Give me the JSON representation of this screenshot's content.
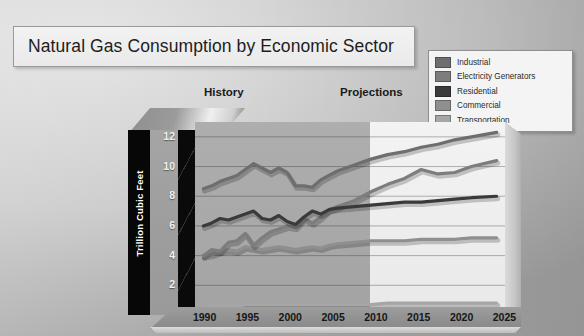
{
  "slide": {
    "title": "Natural Gas Consumption by Economic Sector"
  },
  "captions": {
    "history": "History",
    "projections": "Projections"
  },
  "legend": {
    "items": [
      {
        "label": "Industrial",
        "color": "#6e6e6e"
      },
      {
        "label": "Electricity Generators",
        "color": "#7d7d7d"
      },
      {
        "label": "Residential",
        "color": "#3a3a3a"
      },
      {
        "label": "Commercial",
        "color": "#8f8f8f"
      },
      {
        "label": "Transportation",
        "color": "#a6a6a6"
      }
    ]
  },
  "chart_data": {
    "type": "line",
    "title": "Natural Gas Consumption by Economic Sector",
    "xlabel": "",
    "ylabel": "Trillion Cubic Feet",
    "xlim": [
      1989,
      2026
    ],
    "ylim": [
      0,
      13
    ],
    "yticks": [
      0,
      2,
      4,
      6,
      8,
      10,
      12
    ],
    "xticks": [
      1990,
      1995,
      2000,
      2005,
      2010,
      2015,
      2020,
      2025
    ],
    "grid": true,
    "legend_position": "top-right",
    "history_end": 2005,
    "annotations": [
      "History",
      "Projections"
    ],
    "x": [
      1990,
      1991,
      1992,
      1993,
      1994,
      1995,
      1996,
      1997,
      1998,
      1999,
      2000,
      2001,
      2002,
      2003,
      2004,
      2005,
      2006,
      2008,
      2010,
      2012,
      2014,
      2016,
      2018,
      2020,
      2022,
      2025
    ],
    "series": [
      {
        "name": "Industrial",
        "color": "#6e6e6e",
        "values": [
          8.5,
          8.7,
          9.0,
          9.2,
          9.4,
          9.8,
          10.2,
          9.9,
          9.6,
          9.9,
          9.6,
          8.7,
          8.7,
          8.6,
          9.1,
          9.4,
          9.7,
          10.1,
          10.5,
          10.8,
          11.0,
          11.3,
          11.5,
          11.8,
          12.0,
          12.3
        ]
      },
      {
        "name": "Electricity Generators",
        "color": "#7d7d7d",
        "values": [
          4.0,
          4.4,
          4.3,
          4.9,
          5.0,
          5.5,
          4.7,
          5.2,
          5.6,
          5.8,
          6.0,
          5.9,
          6.5,
          6.2,
          6.6,
          7.1,
          7.3,
          7.7,
          8.3,
          8.8,
          9.2,
          9.8,
          9.5,
          9.6,
          10.0,
          10.4
        ]
      },
      {
        "name": "Residential",
        "color": "#3a3a3a",
        "values": [
          6.0,
          6.2,
          6.5,
          6.4,
          6.6,
          6.8,
          7.0,
          6.5,
          6.4,
          6.7,
          6.3,
          6.1,
          6.6,
          7.0,
          6.8,
          7.1,
          7.2,
          7.3,
          7.4,
          7.5,
          7.6,
          7.6,
          7.7,
          7.8,
          7.9,
          8.0
        ]
      },
      {
        "name": "Commercial",
        "color": "#8f8f8f",
        "values": [
          4.0,
          4.1,
          4.3,
          4.4,
          4.3,
          4.6,
          4.5,
          4.4,
          4.5,
          4.6,
          4.5,
          4.4,
          4.5,
          4.6,
          4.5,
          4.7,
          4.8,
          4.9,
          5.0,
          5.0,
          5.0,
          5.1,
          5.1,
          5.1,
          5.2,
          5.2
        ]
      },
      {
        "name": "Transportation",
        "color": "#a6a6a6",
        "values": [
          0.6,
          0.6,
          0.6,
          0.6,
          0.6,
          0.7,
          0.7,
          0.7,
          0.7,
          0.7,
          0.7,
          0.7,
          0.7,
          0.7,
          0.7,
          0.7,
          0.7,
          0.7,
          0.7,
          0.8,
          0.8,
          0.8,
          0.8,
          0.8,
          0.8,
          0.8
        ]
      }
    ]
  }
}
